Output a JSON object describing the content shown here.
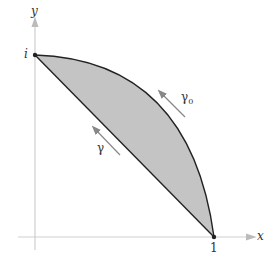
{
  "diagram": {
    "axes": {
      "x_label": "x",
      "y_label": "y"
    },
    "points": {
      "top": "i",
      "right": "1"
    },
    "curves": [
      {
        "name": "γ",
        "label": "γ",
        "description": "straight segment from 1 to i"
      },
      {
        "name": "γ0",
        "label": "γ",
        "subscript": "0",
        "description": "circular arc from 1 to i"
      }
    ],
    "colors": {
      "fill": "#c4c4c4",
      "stroke": "#222222",
      "axis": "#c8c8c8",
      "arrow": "#888888"
    }
  }
}
